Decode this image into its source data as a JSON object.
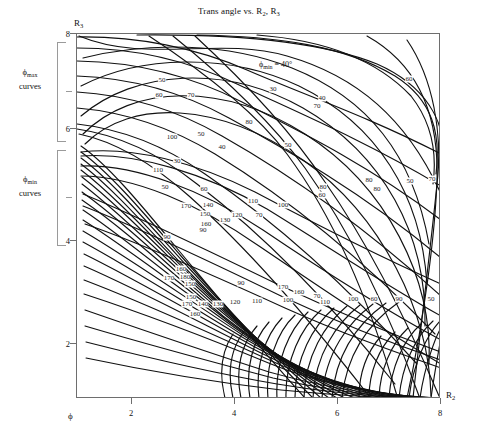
{
  "title": {
    "text_before": "Trans angle vs. R",
    "sub1": "2",
    "mid": ", R",
    "sub2": "3",
    "full": "Trans angle vs. R2, R3"
  },
  "axes": {
    "y_axis_label_main": "R",
    "y_axis_label_sub": "3",
    "x_axis_label_main": "R",
    "x_axis_label_sub": "2",
    "x_axis_phi_symbol": "ϕ",
    "y_ticks": [
      "8",
      "6",
      "4",
      "2"
    ],
    "y_tick_values": [
      8,
      6,
      4,
      2
    ],
    "x_ticks": [
      "2",
      "4",
      "6",
      "8"
    ],
    "x_tick_values": [
      2,
      4,
      6,
      8
    ],
    "xlim": [
      0.85,
      8.35
    ],
    "ylim": [
      1.05,
      8.15
    ]
  },
  "brackets": [
    {
      "label_line1": "ϕ",
      "label_sub": "max",
      "label_line2": "curves"
    },
    {
      "label_line1": "ϕ",
      "label_sub": "min",
      "label_line2": "curves"
    }
  ],
  "annotation": {
    "symbol": "ϕ",
    "sub": "min",
    "equals": " = 40°"
  },
  "chart_data": {
    "type": "line",
    "title": "Trans angle vs. R2, R3",
    "xlabel": "R2",
    "ylabel": "R3",
    "xlim": [
      0.85,
      8.35
    ],
    "ylim": [
      1.05,
      8.15
    ],
    "grid": false,
    "legend": "none",
    "annotations": [
      {
        "text": "ϕmin = 40°",
        "x": 4.8,
        "y": 7.65
      },
      {
        "text": "ϕmax curves",
        "x": -0.6,
        "y": 6.9
      },
      {
        "text": "ϕmin curves",
        "x": -0.6,
        "y": 4.8
      }
    ],
    "contour_levels": [
      30,
      40,
      50,
      60,
      70,
      80,
      90,
      100,
      110,
      120,
      130,
      140,
      150,
      160,
      170
    ],
    "contour_labels": [
      {
        "value": "50",
        "x": 85,
        "y": 46
      },
      {
        "value": "60",
        "x": 82,
        "y": 61
      },
      {
        "value": "70",
        "x": 114,
        "y": 61
      },
      {
        "value": "30",
        "x": 196,
        "y": 55
      },
      {
        "value": "60",
        "x": 332,
        "y": 45
      },
      {
        "value": "40",
        "x": 370,
        "y": 44
      },
      {
        "value": "40",
        "x": 245,
        "y": 64
      },
      {
        "value": "70",
        "x": 240,
        "y": 72
      },
      {
        "value": "80",
        "x": 172,
        "y": 88
      },
      {
        "value": "100",
        "x": 95,
        "y": 103
      },
      {
        "value": "50",
        "x": 124,
        "y": 100
      },
      {
        "value": "40",
        "x": 145,
        "y": 113
      },
      {
        "value": "50",
        "x": 211,
        "y": 111
      },
      {
        "value": "30",
        "x": 100,
        "y": 127
      },
      {
        "value": "110",
        "x": 81,
        "y": 136
      },
      {
        "value": "80",
        "x": 292,
        "y": 146
      },
      {
        "value": "50",
        "x": 333,
        "y": 147
      },
      {
        "value": "70",
        "x": 355,
        "y": 145
      },
      {
        "value": "60",
        "x": 427,
        "y": 138
      },
      {
        "value": "40",
        "x": 431,
        "y": 147
      },
      {
        "value": "50",
        "x": 88,
        "y": 153
      },
      {
        "value": "60",
        "x": 127,
        "y": 155
      },
      {
        "value": "110",
        "x": 176,
        "y": 167
      },
      {
        "value": "100",
        "x": 206,
        "y": 171
      },
      {
        "value": "80",
        "x": 246,
        "y": 153
      },
      {
        "value": "60",
        "x": 245,
        "y": 161
      },
      {
        "value": "80",
        "x": 300,
        "y": 155
      },
      {
        "value": "170",
        "x": 109,
        "y": 172
      },
      {
        "value": "140",
        "x": 131,
        "y": 171
      },
      {
        "value": "150",
        "x": 128,
        "y": 180
      },
      {
        "value": "120",
        "x": 160,
        "y": 181
      },
      {
        "value": "70",
        "x": 182,
        "y": 181
      },
      {
        "value": "130",
        "x": 148,
        "y": 186
      },
      {
        "value": "160",
        "x": 129,
        "y": 190
      },
      {
        "value": "90",
        "x": 126,
        "y": 196
      },
      {
        "value": "90",
        "x": 90,
        "y": 203
      },
      {
        "value": "160",
        "x": 104,
        "y": 235
      },
      {
        "value": "170",
        "x": 92,
        "y": 244
      },
      {
        "value": "180",
        "x": 108,
        "y": 243
      },
      {
        "value": "150",
        "x": 113,
        "y": 250
      },
      {
        "value": "90",
        "x": 164,
        "y": 249
      },
      {
        "value": "170",
        "x": 206,
        "y": 253
      },
      {
        "value": "160",
        "x": 222,
        "y": 258
      },
      {
        "value": "150",
        "x": 114,
        "y": 263
      },
      {
        "value": "170",
        "x": 110,
        "y": 270
      },
      {
        "value": "140",
        "x": 126,
        "y": 270
      },
      {
        "value": "130",
        "x": 141,
        "y": 270
      },
      {
        "value": "120",
        "x": 158,
        "y": 268
      },
      {
        "value": "110",
        "x": 180,
        "y": 267
      },
      {
        "value": "100",
        "x": 211,
        "y": 266
      },
      {
        "value": "160",
        "x": 118,
        "y": 280
      },
      {
        "value": "70",
        "x": 240,
        "y": 262
      },
      {
        "value": "110",
        "x": 248,
        "y": 268
      },
      {
        "value": "100",
        "x": 276,
        "y": 265
      },
      {
        "value": "60",
        "x": 297,
        "y": 265
      },
      {
        "value": "90",
        "x": 322,
        "y": 265
      },
      {
        "value": "50",
        "x": 354,
        "y": 265
      },
      {
        "value": "80",
        "x": 369,
        "y": 265
      },
      {
        "value": "40",
        "x": 400,
        "y": 266
      },
      {
        "value": "70",
        "x": 412,
        "y": 264
      },
      {
        "value": "30",
        "x": 432,
        "y": 266
      },
      {
        "value": "150",
        "x": 174,
        "y": 372
      },
      {
        "value": "170",
        "x": 162,
        "y": 381
      },
      {
        "value": "140",
        "x": 182,
        "y": 380
      },
      {
        "value": "160",
        "x": 170,
        "y": 390
      },
      {
        "value": "130",
        "x": 205,
        "y": 383
      },
      {
        "value": "120",
        "x": 222,
        "y": 383
      },
      {
        "value": "110",
        "x": 240,
        "y": 383
      },
      {
        "value": "100",
        "x": 258,
        "y": 383
      },
      {
        "value": "90",
        "x": 276,
        "y": 383
      },
      {
        "value": "80",
        "x": 296,
        "y": 383
      },
      {
        "value": "70",
        "x": 315,
        "y": 383
      },
      {
        "value": "60",
        "x": 333,
        "y": 383
      },
      {
        "value": "50",
        "x": 348,
        "y": 383
      },
      {
        "value": "40",
        "x": 360,
        "y": 383
      },
      {
        "value": "170",
        "x": 296,
        "y": 372
      },
      {
        "value": "160",
        "x": 332,
        "y": 375
      },
      {
        "value": "140",
        "x": 350,
        "y": 375
      },
      {
        "value": "150",
        "x": 344,
        "y": 382
      },
      {
        "value": "130",
        "x": 362,
        "y": 382
      },
      {
        "value": "120",
        "x": 380,
        "y": 381
      },
      {
        "value": "110",
        "x": 372,
        "y": 387
      },
      {
        "value": "100",
        "x": 398,
        "y": 381
      },
      {
        "value": "10",
        "x": 390,
        "y": 387
      }
    ]
  }
}
